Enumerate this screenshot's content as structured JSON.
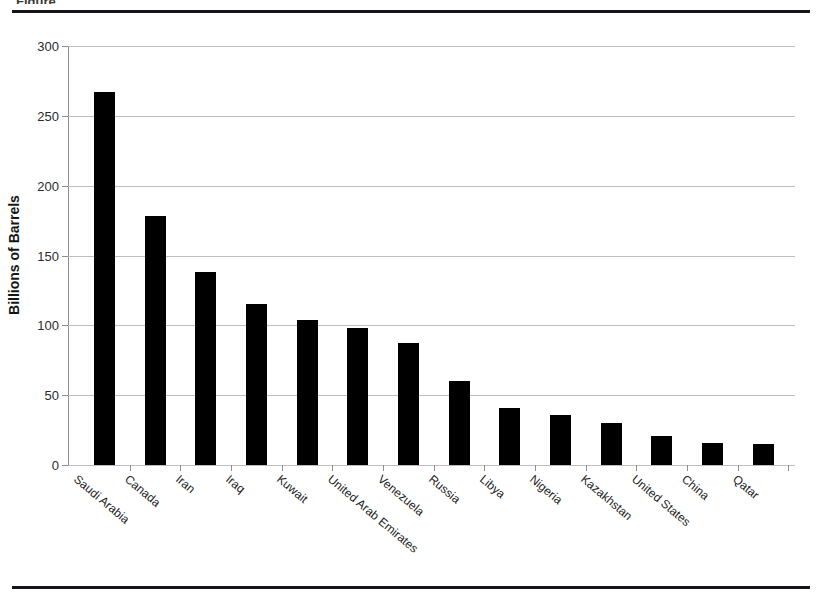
{
  "figure": {
    "caption_sliver": "Figure",
    "background": "#ffffff",
    "rule_color": "#14161a"
  },
  "chart_data": {
    "type": "bar",
    "title": "",
    "subtitle": "",
    "xlabel": "",
    "ylabel": "Billions of Barrels",
    "ylim": [
      0,
      300
    ],
    "yticks": [
      0,
      50,
      100,
      150,
      200,
      250,
      300
    ],
    "ytick_labels": [
      "0",
      "50",
      "100",
      "150",
      "200",
      "250",
      "300"
    ],
    "grid": true,
    "grid_axis": "y",
    "legend": false,
    "bar_color": "#000000",
    "grid_color": "#b9bcc0",
    "axis_color": "#8a8d91",
    "categories": [
      "Saudi Arabia",
      "Canada",
      "Iran",
      "Iraq",
      "Kuwait",
      "United Arab Emirates",
      "Venezuela",
      "Russia",
      "Libya",
      "Nigeria",
      "Kazakhstan",
      "United States",
      "China",
      "Qatar"
    ],
    "values": [
      267,
      178,
      138,
      115,
      104,
      98,
      87,
      60,
      41,
      36,
      30,
      21,
      16,
      15
    ]
  }
}
